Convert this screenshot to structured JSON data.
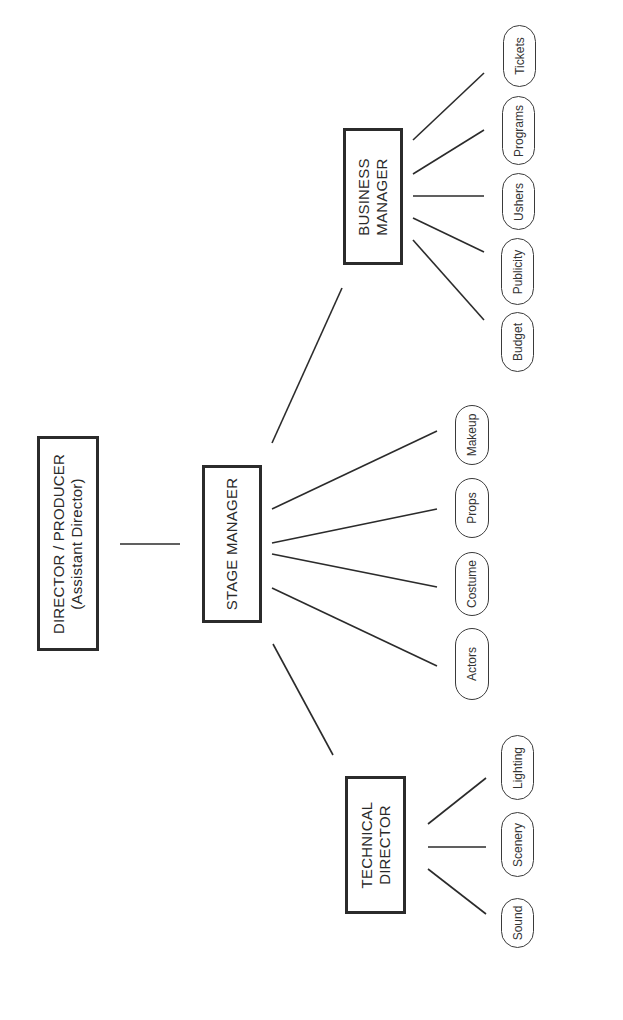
{
  "chart_title": "",
  "nodes": {
    "director": {
      "line1": "DIRECTOR / PRODUCER",
      "line2": "(Assistant Director)"
    },
    "stage_manager": {
      "line1": "STAGE MANAGER"
    },
    "business_manager": {
      "line1": "BUSINESS",
      "line2": "MANAGER"
    },
    "technical_director": {
      "line1": "TECHNICAL",
      "line2": "DIRECTOR"
    }
  },
  "business_children": [
    "Tickets",
    "Programs",
    "Ushers",
    "Publicity",
    "Budget"
  ],
  "stage_children": [
    "Makeup",
    "Props",
    "Costume",
    "Actors"
  ],
  "technical_children": [
    "Lighting",
    "Scenery",
    "Sound"
  ],
  "colors": {
    "line": "#2b2b2b",
    "background": "#ffffff"
  }
}
